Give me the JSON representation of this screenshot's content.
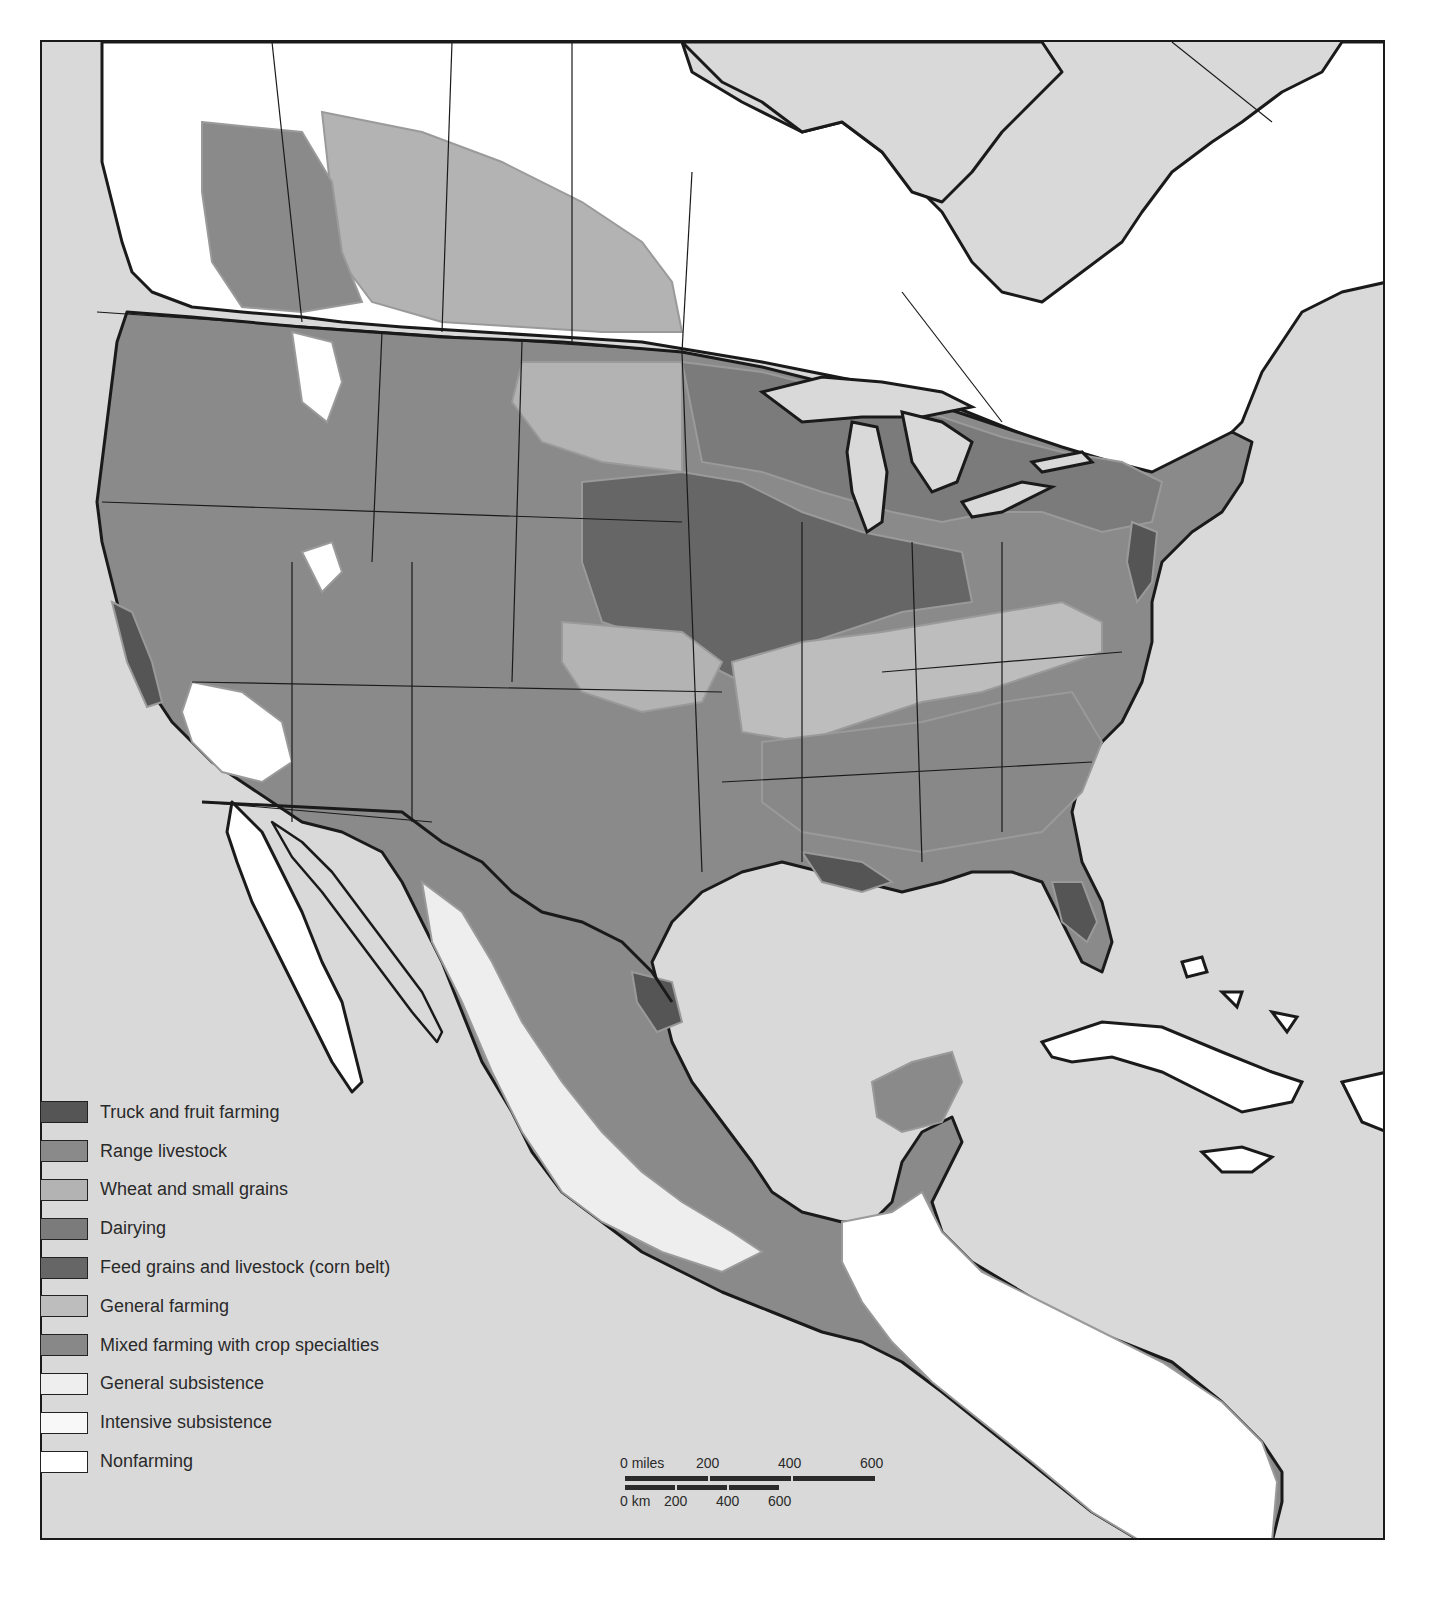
{
  "map": {
    "title": "",
    "background_ocean_color": "#d9d9d9",
    "border_color": "#1a1a1a",
    "region": "North America (United States, southern Canada, Mexico, Central America, Caribbean)"
  },
  "legend": {
    "items": [
      {
        "label": "Truck and fruit farming",
        "color": "#555555"
      },
      {
        "label": "Range livestock",
        "color": "#8a8a8a"
      },
      {
        "label": "Wheat and small grains",
        "color": "#b3b3b3"
      },
      {
        "label": "Dairying",
        "color": "#7b7b7b"
      },
      {
        "label": "Feed grains and livestock (corn belt)",
        "color": "#666666"
      },
      {
        "label": "General farming",
        "color": "#bdbdbd"
      },
      {
        "label": "Mixed farming with crop specialties",
        "color": "#888888"
      },
      {
        "label": "General subsistence",
        "color": "#eeeeee"
      },
      {
        "label": "Intensive subsistence",
        "color": "#f8f8f8"
      },
      {
        "label": "Nonfarming",
        "color": "#ffffff"
      }
    ]
  },
  "scale": {
    "miles_labels": [
      "0 miles",
      "200",
      "400",
      "600"
    ],
    "km_labels": [
      "0 km",
      "200",
      "400",
      "600"
    ]
  }
}
